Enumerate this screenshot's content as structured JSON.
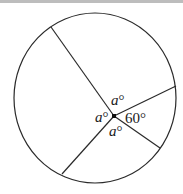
{
  "figure": {
    "type": "circle-with-radii",
    "colors": {
      "stroke": "#2a2a2a",
      "background": "#ffffff",
      "top_strip": "#bdbdbd"
    },
    "circle": {
      "cx": 95,
      "cy": 98,
      "rx": 81,
      "ry": 85
    },
    "center": {
      "x": 114,
      "y": 116
    },
    "radii_endpoints": [
      {
        "name": "upper-left",
        "x": 51,
        "y": 27
      },
      {
        "name": "right",
        "x": 176,
        "y": 86
      },
      {
        "name": "lower-right",
        "x": 160,
        "y": 148
      },
      {
        "name": "lower-left",
        "x": 62,
        "y": 174
      }
    ],
    "angle_labels": {
      "top": {
        "var": "a",
        "deg": "°"
      },
      "left": {
        "var": "a",
        "deg": "°"
      },
      "bottom": {
        "var": "a",
        "deg": "°"
      },
      "right": {
        "text": "60°"
      }
    }
  }
}
